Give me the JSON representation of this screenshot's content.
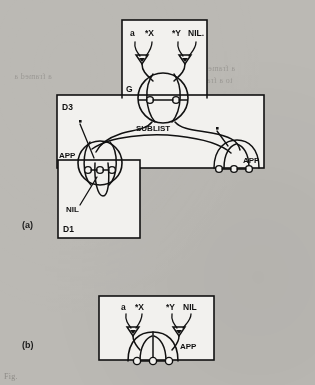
{
  "figure": {
    "background_color": "#bdbbb6",
    "paper_color": "#f2f1ee",
    "ink_color": "#111111",
    "caption": "Fig.",
    "bleed_through_text": {
      "line1": "a framed a",
      "line2": "a frame or",
      "line3": "to a frame"
    }
  },
  "panels": [
    {
      "id": "a",
      "label": "(a)"
    },
    {
      "id": "b",
      "label": "(b)"
    }
  ],
  "boxes": [
    {
      "id": "g",
      "label": "G",
      "panel": "a",
      "x": 122,
      "y": 20,
      "w": 85,
      "h": 78
    },
    {
      "id": "d3",
      "label": "D3",
      "panel": "a",
      "x": 57,
      "y": 95,
      "w": 207,
      "h": 73
    },
    {
      "id": "d1",
      "label": "D1",
      "panel": "a",
      "x": 58,
      "y": 160,
      "w": 82,
      "h": 78
    },
    {
      "id": "b",
      "label": "",
      "panel": "b",
      "x": 99,
      "y": 296,
      "w": 115,
      "h": 64
    }
  ],
  "panel_a": {
    "argument_labels": [
      "a",
      "*X",
      "*Y",
      "NIL."
    ],
    "node_labels": [
      "G",
      "SUBLIST",
      "APP",
      "APP",
      "NIL"
    ],
    "sublist_label": "SUBLIST",
    "app_left_label": "APP",
    "app_right_label": "APP",
    "nil_label": "NIL",
    "star_markers": 2
  },
  "panel_b": {
    "argument_labels": [
      "a",
      "*X",
      "*Y",
      "NIL"
    ],
    "app_label": "APP",
    "node_count": 3
  }
}
